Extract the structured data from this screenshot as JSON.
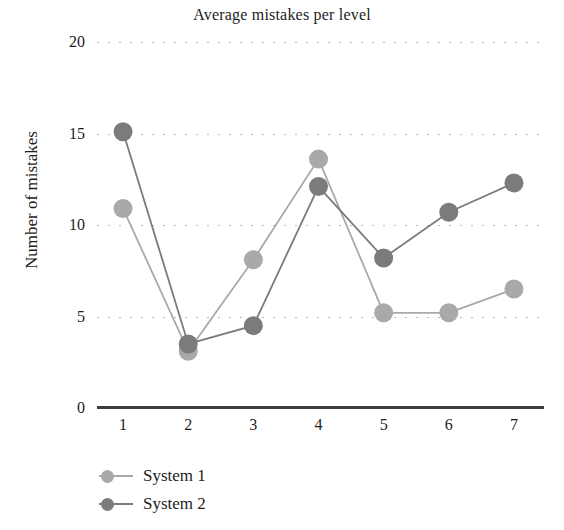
{
  "chart_data": {
    "type": "line",
    "title": "Average mistakes per level",
    "xlabel": "",
    "ylabel": "Number of mistakes",
    "x": [
      1,
      2,
      3,
      4,
      5,
      6,
      7
    ],
    "xtick_labels": [
      "1",
      "2",
      "3",
      "4",
      "5",
      "6",
      "7"
    ],
    "ytick_labels": [
      "0",
      "5",
      "10",
      "15",
      "20"
    ],
    "yticks": [
      0,
      5,
      10,
      15,
      20
    ],
    "ylim": [
      0,
      20
    ],
    "xlim": [
      0.6,
      7.4
    ],
    "grid": "horizontal-dotted",
    "legend_position": "bottom-left",
    "series": [
      {
        "name": "System 1",
        "color": "#a9a9a9",
        "marker": "circle",
        "values": [
          10.9,
          3.1,
          8.1,
          13.6,
          5.2,
          5.2,
          6.5
        ]
      },
      {
        "name": "System 2",
        "color": "#7b7b7b",
        "marker": "circle",
        "values": [
          15.1,
          3.5,
          4.5,
          12.1,
          8.2,
          10.7,
          12.3
        ]
      }
    ]
  },
  "legend": {
    "items": [
      {
        "label": "System 1",
        "color": "#a9a9a9"
      },
      {
        "label": "System 2",
        "color": "#7b7b7b"
      }
    ]
  },
  "axis": {
    "line_color": "#3c3c3c",
    "grid_color": "#b9b9bd"
  }
}
